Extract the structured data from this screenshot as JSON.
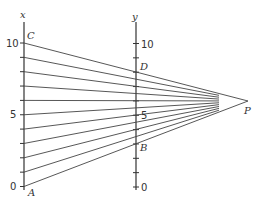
{
  "diagram": {
    "x_axis": {
      "label": "x",
      "ticks": [
        {
          "value": 0,
          "label": "0"
        },
        {
          "value": 5,
          "label": "5"
        },
        {
          "value": 10,
          "label": "10"
        }
      ]
    },
    "y_axis": {
      "label": "y",
      "ticks": [
        {
          "value": 0,
          "label": "0"
        },
        {
          "value": 5,
          "label": "5"
        },
        {
          "value": 10,
          "label": "10"
        }
      ]
    },
    "points": {
      "A": "A",
      "B": "B",
      "C": "C",
      "D": "D",
      "P": "P"
    }
  }
}
